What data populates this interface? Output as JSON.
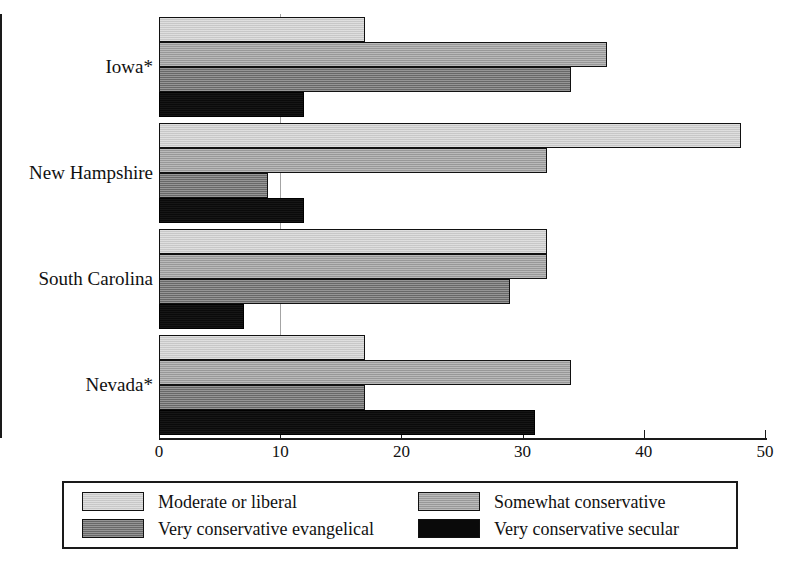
{
  "chart_data": {
    "type": "bar",
    "orientation": "horizontal",
    "title": "",
    "xlabel": "",
    "ylabel": "",
    "xlim": [
      0,
      50
    ],
    "xticks": [
      0,
      10,
      20,
      30,
      40,
      50
    ],
    "xtick_labels": [
      "0",
      "10",
      "20",
      "30",
      "40",
      "50"
    ],
    "grid": true,
    "legend_position": "bottom",
    "categories": [
      "Iowa*",
      "New Hampshire",
      "South Carolina",
      "Nevada*"
    ],
    "series": [
      {
        "name": "Moderate or liberal",
        "color": "#d2d2d2",
        "values": [
          17,
          48,
          32,
          17
        ]
      },
      {
        "name": "Somewhat conservative",
        "color": "#a0a0a0",
        "values": [
          37,
          32,
          32,
          34
        ]
      },
      {
        "name": "Very conservative evangelical",
        "color": "#6e6e6e",
        "values": [
          34,
          9,
          29,
          17
        ]
      },
      {
        "name": "Very conservative secular",
        "color": "#0a0a0a",
        "values": [
          12,
          12,
          7,
          31
        ]
      }
    ]
  },
  "legend": {
    "entries": [
      {
        "label": "Moderate or liberal",
        "swatch": "s0"
      },
      {
        "label": "Somewhat conservative",
        "swatch": "s1"
      },
      {
        "label": "Very conservative evangelical",
        "swatch": "s2"
      },
      {
        "label": "Very conservative secular",
        "swatch": "s3"
      }
    ]
  }
}
